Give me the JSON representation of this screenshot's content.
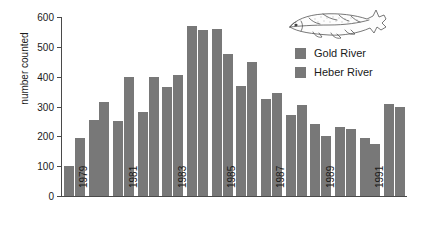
{
  "chart_data": {
    "type": "bar",
    "title": "",
    "xlabel": "",
    "ylabel": "number counted",
    "ylim": [
      0,
      600
    ],
    "yticks": [
      0,
      100,
      200,
      300,
      400,
      500,
      600
    ],
    "grid": false,
    "legend_position": "top-right",
    "categories": [
      "1979",
      "1980",
      "1981",
      "1982",
      "1983",
      "1984",
      "1985",
      "1986",
      "1987",
      "1988",
      "1989",
      "1990",
      "1991",
      "1992"
    ],
    "tick_labels": [
      "1979",
      "1981",
      "1983",
      "1985",
      "1987",
      "1989",
      "1991"
    ],
    "series": [
      {
        "name": "Gold River",
        "color": "#787878",
        "values": [
          100,
          255,
          250,
          280,
          365,
          570,
          560,
          370,
          325,
          270,
          240,
          230,
          195,
          310
        ]
      },
      {
        "name": "Heber River",
        "color": "#787878",
        "values": [
          195,
          315,
          400,
          400,
          405,
          555,
          475,
          450,
          345,
          305,
          200,
          225,
          175,
          300
        ]
      }
    ],
    "annotations": [
      "salmon-illustration"
    ]
  },
  "legend": {
    "items": [
      {
        "label": "Gold River",
        "swatch": "legend-swatch-gold-river"
      },
      {
        "label": "Heber River",
        "swatch": "legend-swatch-heber-river"
      }
    ]
  },
  "illustration": {
    "name": "salmon-fish-drawing"
  }
}
